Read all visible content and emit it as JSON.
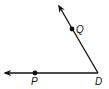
{
  "diagram": {
    "type": "angle",
    "vertex": {
      "label": "D",
      "x": 98,
      "y": 73
    },
    "rays": [
      {
        "name": "ray-DP",
        "from": "D",
        "through": "P",
        "end": {
          "x": 4,
          "y": 73
        }
      },
      {
        "name": "ray-DQ",
        "from": "D",
        "through": "Q",
        "end": {
          "x": 58,
          "y": 4
        }
      }
    ],
    "points": [
      {
        "label": "P",
        "x": 35,
        "y": 73,
        "label_x": 31,
        "label_y": 85
      },
      {
        "label": "Q",
        "x": 72,
        "y": 29,
        "label_x": 76,
        "label_y": 33
      }
    ],
    "vertex_label": {
      "text": "D",
      "x": 95,
      "y": 85
    },
    "stroke_color": "#111111"
  }
}
